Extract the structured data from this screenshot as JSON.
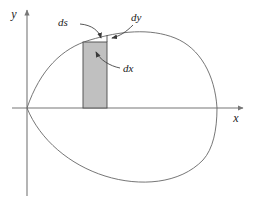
{
  "figure": {
    "type": "calculus-area-diagram",
    "background_color": "#ffffff",
    "stroke_color": "#555555",
    "axis_color": "#777777",
    "rect_fill_color": "#c0c0c0",
    "rect_stroke_color": "#4a4a4a",
    "label_color": "#1a1a1a"
  },
  "axes": {
    "y_axis": {
      "label": "y",
      "icon": "arrow-up-icon",
      "x": 27,
      "y_top": 8,
      "y_bottom": 196,
      "label_x": 14,
      "label_y": 18
    },
    "x_axis": {
      "label": "x",
      "icon": "arrow-right-icon",
      "y": 108,
      "x_left": 12,
      "x_right": 245,
      "label_x": 236,
      "label_y": 122
    },
    "origin": {
      "x": 27,
      "y": 108
    }
  },
  "curve": {
    "name": "closed-curve",
    "cusp_at_origin": true,
    "upper_path": "M 27 108 C 40 70, 62 48, 90 40 C 120 31, 150 28, 175 38 C 200 48, 215 75, 217 108",
    "lower_path": "M 27 108 C 40 140, 70 165, 105 176 C 140 187, 180 184, 203 160 C 213 149, 217 130, 217 108",
    "rightmost_x": 217
  },
  "rectangle": {
    "name": "differential-area-element",
    "x": 83,
    "y": 42,
    "width": 24,
    "height": 66,
    "fill": "#c0c0c0"
  },
  "dy_segment": {
    "name": "dy-height-segment",
    "x": 107,
    "y_top": 35,
    "y_bottom": 42
  },
  "annotations": [
    {
      "id": "ds",
      "label": "ds",
      "label_x": 58,
      "label_y": 26,
      "arrow_path": "M 80 24 C 92 25, 99 31, 101 38",
      "arrow_tip": {
        "x": 101,
        "y": 40
      },
      "arrow_angle": 72,
      "points_to": "arc-length-element-on-curve"
    },
    {
      "id": "dy",
      "label": "dy",
      "label_x": 131,
      "label_y": 21,
      "arrow_path": "M 133 25 C 126 32, 120 36, 112 38",
      "arrow_tip": {
        "x": 109,
        "y": 38
      },
      "arrow_angle": 195,
      "points_to": "vertical-dy-segment"
    },
    {
      "id": "dx",
      "label": "dx",
      "label_x": 123,
      "label_y": 72,
      "arrow_path": "M 120 68 C 110 66, 100 60, 96 52",
      "arrow_tip": {
        "x": 95,
        "y": 50
      },
      "arrow_angle": 245,
      "points_to": "rectangle-width-dx"
    }
  ]
}
